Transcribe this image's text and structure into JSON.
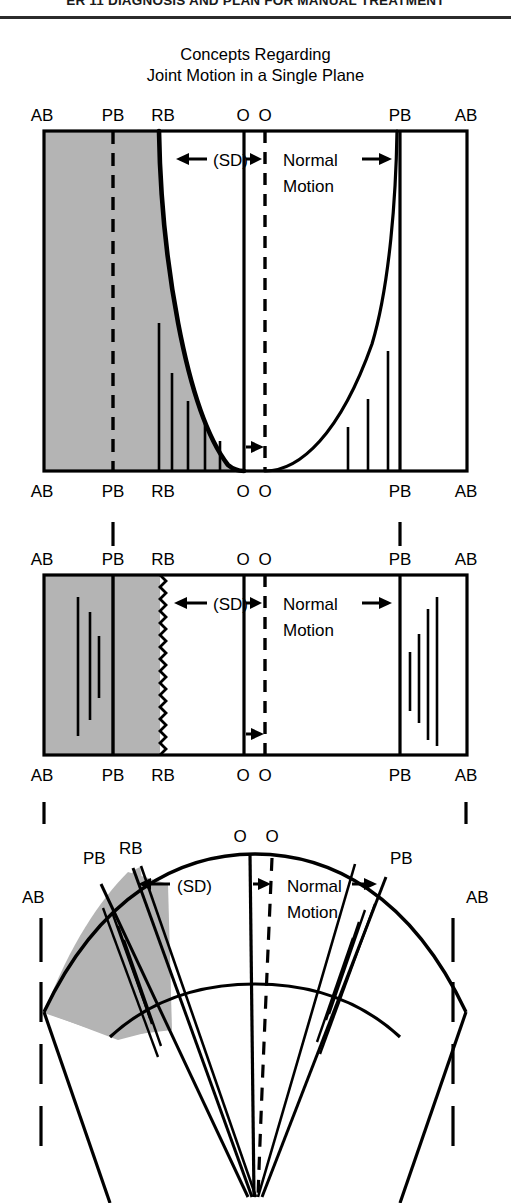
{
  "running_head": {
    "text": "ER 11 DIAGNOSIS AND PLAN FOR MANUAL TREATMENT"
  },
  "figure": {
    "title_line1": "Concepts Regarding",
    "title_line2": "Joint Motion in a Single Plane",
    "shade_color": "#b4b4b4",
    "ink_color": "#000000",
    "annotations": {
      "sd": "(SD)",
      "normal_line1": "Normal",
      "normal_line2": "Motion"
    },
    "boundary_labels": {
      "ab": "AB",
      "pb": "PB",
      "rb": "RB",
      "o": "O"
    }
  },
  "panels": [
    {
      "id": "panel-elastic-barrier",
      "top_labels": [
        "AB",
        "PB",
        "RB",
        "O",
        "O",
        "PB",
        "AB"
      ],
      "bottom_labels": [
        "AB",
        "PB",
        "RB",
        "O",
        "O",
        "PB",
        "AB"
      ],
      "restrictive_edge": "smooth-curve",
      "shaded_side": "left",
      "sd_label": "(SD)",
      "normal_motion_label_line1": "Normal",
      "normal_motion_label_line2": "Motion",
      "left_bar_heights": [
        148,
        98,
        70,
        48,
        30
      ],
      "right_bar_heights": [
        120,
        72,
        44
      ]
    },
    {
      "id": "panel-restrictive-barrier",
      "top_labels": [
        "AB",
        "PB",
        "RB",
        "O",
        "O",
        "PB",
        "AB"
      ],
      "bottom_labels": [
        "AB",
        "PB",
        "RB",
        "O",
        "O",
        "PB",
        "AB"
      ],
      "restrictive_edge": "zigzag",
      "shaded_side": "left",
      "sd_label": "(SD)",
      "normal_motion_label_line1": "Normal",
      "normal_motion_label_line2": "Motion",
      "left_bar_heights": [
        120,
        88,
        56
      ],
      "right_bar_heights": [
        62,
        88,
        128,
        150
      ]
    },
    {
      "id": "panel-fan-sector",
      "labels": [
        "AB",
        "PB",
        "RB",
        "O",
        "O",
        "PB",
        "AB"
      ],
      "shaded_side": "left",
      "sd_label": "(SD)",
      "normal_motion_label_line1": "Normal",
      "normal_motion_label_line2": "Motion"
    }
  ]
}
